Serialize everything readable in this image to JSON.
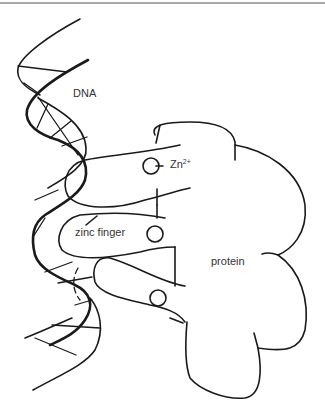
{
  "figure": {
    "labels": {
      "dna": "DNA",
      "zinc_ion": "Zn",
      "zinc_charge": "2+",
      "zinc_finger": "zinc finger",
      "protein": "protein"
    },
    "colors": {
      "line": "#1a1a1a",
      "text": "#333333",
      "background": "#ffffff",
      "border": "#a9a9a9"
    },
    "components": [
      "DNA double helix",
      "three zinc fingers",
      "three Zn2+ ions",
      "protein body"
    ],
    "zinc_finger_count": 3
  }
}
